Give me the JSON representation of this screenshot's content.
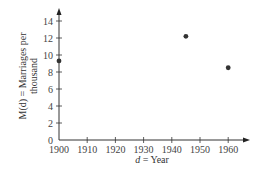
{
  "chart_data": {
    "type": "scatter",
    "title": "",
    "xlabel": "d = Year",
    "xlabel_var": "d",
    "xlabel_rest": " = Year",
    "ylabel_line1": "M(d) = Marriages per",
    "ylabel_line2": "thousand",
    "xlim": [
      1900,
      1965
    ],
    "ylim": [
      0,
      15
    ],
    "x_ticks": [
      1900,
      1910,
      1920,
      1930,
      1940,
      1950,
      1960
    ],
    "y_ticks": [
      0,
      2,
      4,
      6,
      8,
      10,
      12,
      14
    ],
    "grid": false,
    "legend": null,
    "series": [
      {
        "name": "Marriages per thousand",
        "points": [
          {
            "x": 1900,
            "y": 9.3
          },
          {
            "x": 1945,
            "y": 12.2
          },
          {
            "x": 1960,
            "y": 8.5
          }
        ]
      }
    ],
    "colors": {
      "axis": "#333333",
      "point": "#333333",
      "text": "#444444"
    }
  }
}
